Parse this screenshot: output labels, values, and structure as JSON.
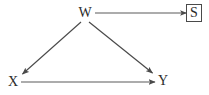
{
  "diagram": {
    "type": "directed-acyclic-graph",
    "title": "",
    "background_color": "#ffffff",
    "stroke_color": "#4a4a4a",
    "text_color": "#2b2b2b",
    "nodes": [
      {
        "id": "W",
        "label": "W",
        "shape": "plain",
        "x": 85,
        "y": 13
      },
      {
        "id": "S",
        "label": "S",
        "shape": "box",
        "x": 194,
        "y": 13
      },
      {
        "id": "X",
        "label": "X",
        "shape": "plain",
        "x": 13,
        "y": 82
      },
      {
        "id": "Y",
        "label": "Y",
        "shape": "plain",
        "x": 163,
        "y": 81
      }
    ],
    "edges": [
      {
        "from": "W",
        "to": "S",
        "label": "",
        "directed": true
      },
      {
        "from": "W",
        "to": "X",
        "label": "",
        "directed": true
      },
      {
        "from": "W",
        "to": "Y",
        "label": "",
        "directed": true
      },
      {
        "from": "X",
        "to": "Y",
        "label": "",
        "directed": true
      }
    ]
  }
}
